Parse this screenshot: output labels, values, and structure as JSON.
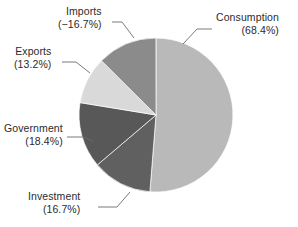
{
  "chart_data": {
    "type": "pie",
    "title": "",
    "subtitle": "",
    "xlabel": "",
    "ylabel": "",
    "legend_position": "none",
    "grid": false,
    "center_px": [
      156,
      115
    ],
    "radius_px": 77,
    "start_angle_deg": 0,
    "direction": "clockwise",
    "note": "Slice angles are proportional to the absolute value of each percentage; Imports is a negative contribution but drawn with its magnitude.",
    "categories": [
      "Consumption",
      "Investment",
      "Government",
      "Exports",
      "Imports"
    ],
    "values": [
      68.4,
      16.7,
      18.4,
      13.2,
      -16.7
    ],
    "labels": [
      "(68.4%)",
      "(16.7%)",
      "(18.4%)",
      "(13.2%)",
      "(−16.7%)"
    ],
    "colors": [
      "#b9b9b9",
      "#606060",
      "#585858",
      "#d9d9d9",
      "#8b8b8b"
    ],
    "slices": [
      {
        "name": "Consumption",
        "value": 68.4,
        "display_value": "(68.4%)",
        "color": "#b9b9b9",
        "magnitude": 68.4,
        "start_deg": 0,
        "sweep_deg": 184.56,
        "label_align": "right",
        "leader": {
          "x1": 212,
          "y1": 29,
          "x2": 197,
          "y2": 29,
          "x3": 183,
          "y3": 44
        }
      },
      {
        "name": "Investment",
        "value": 16.7,
        "display_value": "(16.7%)",
        "color": "#606060",
        "magnitude": 16.7,
        "start_deg": 184.56,
        "sweep_deg": 45.06,
        "label_align": "right",
        "leader": {
          "x1": 98,
          "y1": 207,
          "x2": 117,
          "y2": 207,
          "x3": 130,
          "y3": 192
        }
      },
      {
        "name": "Government",
        "value": 18.4,
        "display_value": "(18.4%)",
        "color": "#585858",
        "magnitude": 18.4,
        "start_deg": 229.62,
        "sweep_deg": 49.65,
        "label_align": "right",
        "leader": {
          "x1": 67,
          "y1": 137,
          "x2": 83,
          "y2": 137,
          "x3": 93,
          "y3": 141
        }
      },
      {
        "name": "Exports",
        "value": 13.2,
        "display_value": "(13.2%)",
        "color": "#d9d9d9",
        "magnitude": 13.2,
        "start_deg": 279.27,
        "sweep_deg": 35.62,
        "label_align": "right",
        "leader": {
          "x1": 62,
          "y1": 62,
          "x2": 76,
          "y2": 62,
          "x3": 90,
          "y3": 73
        }
      },
      {
        "name": "Imports",
        "value": -16.7,
        "display_value": "(−16.7%)",
        "color": "#8b8b8b",
        "magnitude": 16.7,
        "start_deg": 314.89,
        "sweep_deg": 45.06,
        "label_align": "right",
        "leader": {
          "x1": 112,
          "y1": 22,
          "x2": 122,
          "y2": 22,
          "x3": 134,
          "y3": 38
        }
      }
    ],
    "total_magnitude": 133.4,
    "background_color": "#ffffff",
    "text_color": "#2b2b2b",
    "leader_line_color": "#6b6b6b"
  },
  "labels": {
    "consumption": {
      "name": "Consumption",
      "pct": "(68.4%)"
    },
    "investment": {
      "name": "Investment",
      "pct": "(16.7%)"
    },
    "government": {
      "name": "Government",
      "pct": "(18.4%)"
    },
    "exports": {
      "name": "Exports",
      "pct": "(13.2%)"
    },
    "imports": {
      "name": "Imports",
      "pct": "(−16.7%)"
    }
  }
}
